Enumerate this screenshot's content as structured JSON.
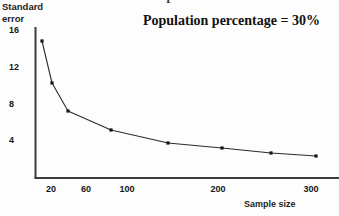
{
  "figure": {
    "title_cropped": "measures with sample size",
    "background_color": "#fdfdfd",
    "line_color": "#2b2b2b",
    "marker_color": "#151515",
    "axis_color": "#3c3c3c"
  },
  "annotation": {
    "text": "Population percentage = 30%"
  },
  "axis_titles": {
    "y": "Standard\nerror",
    "y_line1": "Standard",
    "y_line2": "error",
    "x": "Sample size"
  },
  "chart_data": {
    "type": "line",
    "title": "measures with sample size",
    "xlabel": "Sample size",
    "ylabel": "Standard error",
    "grid": false,
    "legend": null,
    "annotations": [
      "Population percentage = 30%"
    ],
    "xtick_labels": [
      "20",
      "60",
      "100",
      "200",
      "300"
    ],
    "xtick_values": [
      20,
      60,
      100,
      200,
      300
    ],
    "ytick_labels": [
      "16",
      "12",
      "8",
      "4"
    ],
    "ytick_values": [
      16,
      12,
      8,
      4
    ],
    "ylim": [
      0,
      17.6
    ],
    "xlim": [
      0,
      330
    ],
    "x": [
      10,
      20,
      40,
      80,
      140,
      200,
      255,
      310
    ],
    "values": [
      14.8,
      10.2,
      7.2,
      5.1,
      3.7,
      3.1,
      2.6,
      2.3
    ],
    "series": [
      {
        "name": "Standard error",
        "x": [
          10,
          20,
          40,
          80,
          140,
          200,
          255,
          310
        ],
        "values": [
          14.8,
          10.2,
          7.2,
          5.1,
          3.7,
          3.1,
          2.6,
          2.3
        ]
      }
    ],
    "pixel_points": [
      [
        42,
        41
      ],
      [
        52,
        83
      ],
      [
        68,
        111
      ],
      [
        111,
        130
      ],
      [
        168,
        143
      ],
      [
        222,
        148
      ],
      [
        271,
        153
      ],
      [
        316,
        156
      ]
    ],
    "xtick_pixels": [
      51,
      86,
      127,
      218,
      311
    ],
    "ytick_pixels": [
      30,
      67,
      104,
      140
    ]
  }
}
